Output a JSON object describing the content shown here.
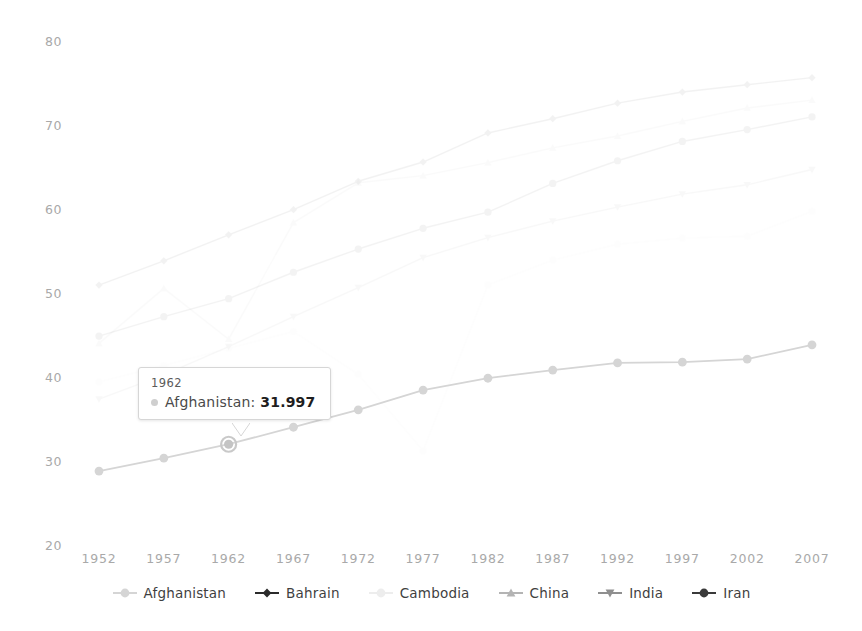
{
  "chart_data": {
    "type": "line",
    "title": "",
    "xlabel": "",
    "ylabel": "",
    "x": [
      1952,
      1957,
      1962,
      1967,
      1972,
      1977,
      1982,
      1987,
      1992,
      1997,
      2002,
      2007
    ],
    "xtick_labels": [
      "1952",
      "1957",
      "1962",
      "1967",
      "1972",
      "1977",
      "1982",
      "1987",
      "1992",
      "1997",
      "2002",
      "2007"
    ],
    "ytick_labels": [
      "80",
      "70",
      "60",
      "50",
      "40",
      "30",
      "20"
    ],
    "ylim": [
      20,
      80
    ],
    "xlim": [
      1952,
      2007
    ],
    "grid": false,
    "legend_position": "bottom",
    "series": [
      {
        "name": "Afghanistan",
        "color": "#d5d5d5",
        "marker": "circle",
        "highlighted": true,
        "values": [
          28.801,
          30.332,
          31.997,
          34.02,
          36.088,
          38.438,
          39.854,
          40.822,
          41.674,
          41.763,
          42.129,
          43.828
        ]
      },
      {
        "name": "Bahrain",
        "color": "#2b2b2b",
        "marker": "diamond",
        "highlighted": false,
        "values": [
          50.939,
          53.832,
          56.923,
          59.923,
          63.3,
          65.593,
          69.052,
          70.75,
          72.601,
          73.925,
          74.795,
          75.635
        ]
      },
      {
        "name": "Cambodia",
        "color": "#ededed",
        "marker": "circle",
        "highlighted": false,
        "values": [
          39.417,
          41.366,
          43.415,
          45.415,
          40.317,
          31.22,
          50.957,
          53.914,
          55.803,
          56.534,
          56.752,
          59.723
        ]
      },
      {
        "name": "China",
        "color": "#b4b4b4",
        "marker": "triangle-up",
        "highlighted": false,
        "values": [
          44.0,
          50.54896,
          44.50136,
          58.38112,
          63.11888,
          63.96736,
          65.525,
          67.274,
          68.69,
          70.426,
          72.028,
          72.961
        ]
      },
      {
        "name": "India",
        "color": "#8f8f8f",
        "marker": "triangle-down",
        "highlighted": false,
        "values": [
          37.373,
          40.249,
          43.605,
          47.193,
          50.651,
          54.208,
          56.596,
          58.553,
          60.223,
          61.765,
          62.879,
          64.698
        ]
      },
      {
        "name": "Iran",
        "color": "#3a3a3a",
        "marker": "circle-filled",
        "highlighted": false,
        "values": [
          44.869,
          47.181,
          49.325,
          52.469,
          55.234,
          57.702,
          59.62,
          63.04,
          65.742,
          68.042,
          69.451,
          70.964
        ]
      }
    ],
    "tooltip": {
      "visible": true,
      "header": "1962",
      "series_name": "Afghanistan",
      "separator": ":",
      "value": "31.997",
      "swatch_color": "#cfcfcf"
    }
  },
  "axis": {
    "y_ticks": [
      {
        "label": "80",
        "value": 80
      },
      {
        "label": "70",
        "value": 70
      },
      {
        "label": "60",
        "value": 60
      },
      {
        "label": "50",
        "value": 50
      },
      {
        "label": "40",
        "value": 40
      },
      {
        "label": "30",
        "value": 30
      },
      {
        "label": "20",
        "value": 20
      }
    ],
    "x_ticks": [
      {
        "label": "1952",
        "value": 1952
      },
      {
        "label": "1957",
        "value": 1957
      },
      {
        "label": "1962",
        "value": 1962
      },
      {
        "label": "1967",
        "value": 1967
      },
      {
        "label": "1972",
        "value": 1972
      },
      {
        "label": "1977",
        "value": 1977
      },
      {
        "label": "1982",
        "value": 1982
      },
      {
        "label": "1987",
        "value": 1987
      },
      {
        "label": "1992",
        "value": 1992
      },
      {
        "label": "1997",
        "value": 1997
      },
      {
        "label": "2002",
        "value": 2002
      },
      {
        "label": "2007",
        "value": 2007
      }
    ]
  },
  "legend": {
    "items": [
      {
        "label": "Afghanistan",
        "color": "#d5d5d5",
        "marker": "circle"
      },
      {
        "label": "Bahrain",
        "color": "#2b2b2b",
        "marker": "diamond"
      },
      {
        "label": "Cambodia",
        "color": "#ededed",
        "marker": "circle"
      },
      {
        "label": "China",
        "color": "#b4b4b4",
        "marker": "triangle-up"
      },
      {
        "label": "India",
        "color": "#8f8f8f",
        "marker": "triangle-down"
      },
      {
        "label": "Iran",
        "color": "#3a3a3a",
        "marker": "circle-filled"
      }
    ]
  }
}
